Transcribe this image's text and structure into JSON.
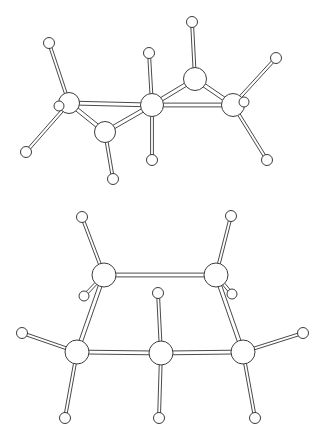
{
  "figure": {
    "background_color": "#ffffff",
    "line_color": "#4a4a4a",
    "atom_fill_color": "#ffffff",
    "atom_stroke_color": "#3c3c3c",
    "width": 323,
    "height": 442,
    "panel_count": 2
  },
  "chart_data": {
    "type": "diagram",
    "xlabel": "",
    "ylabel": "",
    "grid": false,
    "legend": "none",
    "panels": [
      {
        "name": "top-molecule",
        "label": "chair conformer (perspective view)",
        "atom_radius_carbon": 10,
        "atom_radius_hydrogen": 5.5,
        "carbons": [
          {
            "id": "C1",
            "x": 69,
            "y": 103,
            "r": 10.5
          },
          {
            "id": "C2",
            "x": 105,
            "y": 132,
            "r": 10.5
          },
          {
            "id": "C3",
            "x": 152,
            "y": 105,
            "r": 11.5
          },
          {
            "id": "C4",
            "x": 195,
            "y": 79,
            "r": 11.5
          },
          {
            "id": "C5",
            "x": 233,
            "y": 105,
            "r": 11.5
          }
        ],
        "hydrogens": [
          {
            "id": "H1",
            "x": 49,
            "y": 43,
            "r": 5.5
          },
          {
            "id": "H2",
            "x": 59,
            "y": 106,
            "r": 5.0
          },
          {
            "id": "H3",
            "x": 26,
            "y": 152,
            "r": 5.5
          },
          {
            "id": "H4",
            "x": 113,
            "y": 179,
            "r": 5.5
          },
          {
            "id": "H5",
            "x": 149,
            "y": 53,
            "r": 5.5
          },
          {
            "id": "H6",
            "x": 152,
            "y": 160,
            "r": 5.5
          },
          {
            "id": "H7",
            "x": 192,
            "y": 22,
            "r": 5.5
          },
          {
            "id": "H8",
            "x": 276,
            "y": 58,
            "r": 5.5
          },
          {
            "id": "H9",
            "x": 244,
            "y": 102,
            "r": 5.0
          },
          {
            "id": "H10",
            "x": 267,
            "y": 160,
            "r": 5.5
          }
        ],
        "bonds": [
          {
            "from": "C1",
            "to": "C2",
            "type": "double-rail"
          },
          {
            "from": "C1",
            "to": "C3",
            "type": "double-rail"
          },
          {
            "from": "C2",
            "to": "C3",
            "type": "double-rail"
          },
          {
            "from": "C3",
            "to": "C4",
            "type": "double-rail"
          },
          {
            "from": "C3",
            "to": "C5",
            "type": "double-rail"
          },
          {
            "from": "C4",
            "to": "C5",
            "type": "double-rail"
          },
          {
            "from": "C1",
            "to": "H1",
            "type": "double-rail"
          },
          {
            "from": "C1",
            "to": "H2",
            "type": "double-rail"
          },
          {
            "from": "C1",
            "to": "H3",
            "type": "double-rail"
          },
          {
            "from": "C2",
            "to": "H4",
            "type": "double-rail"
          },
          {
            "from": "C3",
            "to": "H5",
            "type": "double-rail"
          },
          {
            "from": "C3",
            "to": "H6",
            "type": "double-rail"
          },
          {
            "from": "C4",
            "to": "H7",
            "type": "double-rail"
          },
          {
            "from": "C5",
            "to": "H8",
            "type": "double-rail"
          },
          {
            "from": "C5",
            "to": "H9",
            "type": "double-rail"
          },
          {
            "from": "C5",
            "to": "H10",
            "type": "double-rail"
          }
        ]
      },
      {
        "name": "bottom-molecule",
        "label": "boat conformer (front view)",
        "atom_radius_carbon": 11,
        "atom_radius_hydrogen": 5.5,
        "carbons": [
          {
            "id": "C1",
            "x": 104,
            "y": 275,
            "r": 12.0
          },
          {
            "id": "C2",
            "x": 216,
            "y": 275,
            "r": 12.0
          },
          {
            "id": "C3",
            "x": 77,
            "y": 352,
            "r": 12.0
          },
          {
            "id": "C4",
            "x": 161,
            "y": 353,
            "r": 12.0
          },
          {
            "id": "C5",
            "x": 243,
            "y": 352,
            "r": 12.0
          }
        ],
        "hydrogens": [
          {
            "id": "H1",
            "x": 82,
            "y": 217,
            "r": 5.5
          },
          {
            "id": "H2",
            "x": 84,
            "y": 296,
            "r": 5.0
          },
          {
            "id": "H3",
            "x": 231,
            "y": 216,
            "r": 5.5
          },
          {
            "id": "H4",
            "x": 232,
            "y": 294,
            "r": 5.0
          },
          {
            "id": "H5",
            "x": 22,
            "y": 333,
            "r": 5.5
          },
          {
            "id": "H6",
            "x": 65,
            "y": 418,
            "r": 5.5
          },
          {
            "id": "H7",
            "x": 158,
            "y": 293,
            "r": 5.5
          },
          {
            "id": "H8",
            "x": 159,
            "y": 418,
            "r": 5.5
          },
          {
            "id": "H9",
            "x": 303,
            "y": 333,
            "r": 5.5
          },
          {
            "id": "H10",
            "x": 255,
            "y": 418,
            "r": 5.5
          }
        ],
        "bonds": [
          {
            "from": "C1",
            "to": "C2",
            "type": "double-rail"
          },
          {
            "from": "C1",
            "to": "C3",
            "type": "double-rail"
          },
          {
            "from": "C2",
            "to": "C5",
            "type": "double-rail"
          },
          {
            "from": "C3",
            "to": "C4",
            "type": "double-rail"
          },
          {
            "from": "C4",
            "to": "C5",
            "type": "double-rail"
          },
          {
            "from": "C1",
            "to": "H1",
            "type": "double-rail"
          },
          {
            "from": "C1",
            "to": "H2",
            "type": "double-rail"
          },
          {
            "from": "C2",
            "to": "H3",
            "type": "double-rail"
          },
          {
            "from": "C2",
            "to": "H4",
            "type": "double-rail"
          },
          {
            "from": "C3",
            "to": "H5",
            "type": "double-rail"
          },
          {
            "from": "C3",
            "to": "H6",
            "type": "double-rail"
          },
          {
            "from": "C4",
            "to": "H7",
            "type": "double-rail"
          },
          {
            "from": "C4",
            "to": "H8",
            "type": "double-rail"
          },
          {
            "from": "C5",
            "to": "H9",
            "type": "double-rail"
          },
          {
            "from": "C5",
            "to": "H10",
            "type": "double-rail"
          }
        ]
      }
    ]
  }
}
